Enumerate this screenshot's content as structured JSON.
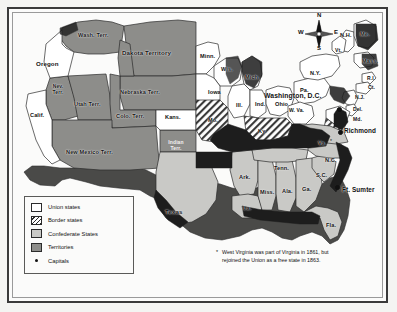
{
  "map": {
    "title": "The United States in 1861",
    "colors": {
      "union": "#ffffff",
      "confederate": "#c9c9c6",
      "territory": "#8d8d8a",
      "outline": "#2b2b2b",
      "shadow": "#4a4a48",
      "paper": "#fbfbfa"
    }
  },
  "compass": {
    "north": "N",
    "south": "S",
    "east": "E",
    "west": "W"
  },
  "legend": {
    "items": [
      {
        "label": "Union states",
        "swatch": "union"
      },
      {
        "label": "Border states",
        "swatch": "border"
      },
      {
        "label": "Confederate States",
        "swatch": "confederate"
      },
      {
        "label": "Territories",
        "swatch": "territory"
      },
      {
        "label": "Capitals",
        "swatch": "capital-dot"
      }
    ]
  },
  "footnote": {
    "marker": "*",
    "text": "West Virginia was part of Virginia in 1861, but rejoined the Union as a free state in 1863."
  },
  "labels": {
    "territories": [
      {
        "name": "Wash. Terr.",
        "x": 88,
        "y": 35
      },
      {
        "name": "Dakota Territory",
        "x": 148,
        "y": 52
      },
      {
        "name": "Nebraska Terr.",
        "x": 144,
        "y": 92
      },
      {
        "name": "Nev. Terr.",
        "x": 55,
        "y": 89
      },
      {
        "name": "Utah Terr.",
        "x": 84,
        "y": 104
      },
      {
        "name": "Colo. Terr.",
        "x": 131,
        "y": 116
      },
      {
        "name": "New Mexico Terr.",
        "x": 94,
        "y": 152
      },
      {
        "name": "Indian Terr.",
        "x": 173,
        "y": 145
      }
    ],
    "union_states": [
      {
        "name": "Oregon",
        "x": 45,
        "y": 63
      },
      {
        "name": "Calif.",
        "x": 38,
        "y": 115
      },
      {
        "name": "Kans.",
        "x": 173,
        "y": 117
      },
      {
        "name": "Minn.",
        "x": 207,
        "y": 56
      },
      {
        "name": "Wis.",
        "x": 226,
        "y": 69
      },
      {
        "name": "Iowa",
        "x": 215,
        "y": 92
      },
      {
        "name": "Mich.",
        "x": 251,
        "y": 77
      },
      {
        "name": "Ill.",
        "x": 240,
        "y": 105
      },
      {
        "name": "Ind.",
        "x": 262,
        "y": 104
      },
      {
        "name": "Ohio",
        "x": 281,
        "y": 104
      },
      {
        "name": "Pa.",
        "x": 303,
        "y": 90
      },
      {
        "name": "N.Y.",
        "x": 316,
        "y": 73
      },
      {
        "name": "N.H.",
        "x": 346,
        "y": 35
      },
      {
        "name": "Me.",
        "x": 366,
        "y": 34
      },
      {
        "name": "Vt.",
        "x": 340,
        "y": 50
      },
      {
        "name": "Mass.",
        "x": 367,
        "y": 61
      },
      {
        "name": "R.I.",
        "x": 371,
        "y": 79
      },
      {
        "name": "Ct.",
        "x": 369,
        "y": 88
      },
      {
        "name": "N.J.",
        "x": 359,
        "y": 98
      },
      {
        "name": "Del.",
        "x": 356,
        "y": 110
      },
      {
        "name": "Md.",
        "x": 355,
        "y": 120
      },
      {
        "name": "W. Va.",
        "x": 296,
        "y": 111
      }
    ],
    "border_states": [
      {
        "name": "Mo.",
        "x": 214,
        "y": 120
      },
      {
        "name": "Ky.",
        "x": 263,
        "y": 131
      }
    ],
    "confederate_states": [
      {
        "name": "Texas",
        "x": 175,
        "y": 211
      },
      {
        "name": "Ark.",
        "x": 244,
        "y": 177
      },
      {
        "name": "La.",
        "x": 248,
        "y": 208
      },
      {
        "name": "Miss.",
        "x": 266,
        "y": 192
      },
      {
        "name": "Ala.",
        "x": 287,
        "y": 191
      },
      {
        "name": "Tenn.",
        "x": 281,
        "y": 168
      },
      {
        "name": "Ga.",
        "x": 306,
        "y": 189
      },
      {
        "name": "Fla.",
        "x": 330,
        "y": 225
      },
      {
        "name": "S.C.",
        "x": 321,
        "y": 175
      },
      {
        "name": "N.C.",
        "x": 330,
        "y": 160
      },
      {
        "name": "Va.",
        "x": 323,
        "y": 143,
        "star": "*"
      }
    ],
    "cities": [
      {
        "name": "Washington, D.C.",
        "x": 287,
        "y": 95,
        "dot_x": 338,
        "dot_y": 108
      },
      {
        "name": "Richmond",
        "x": 345,
        "y": 130,
        "dot_x": 339,
        "dot_y": 131
      },
      {
        "name": "Ft. Sumter",
        "x": 343,
        "y": 189,
        "dot_x": 336,
        "dot_y": 186
      }
    ]
  }
}
